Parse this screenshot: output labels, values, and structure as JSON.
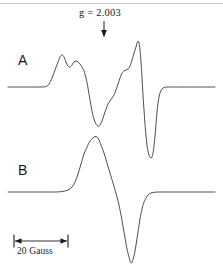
{
  "figure": {
    "type": "epr-spectrum-figure",
    "width": 223,
    "height": 277,
    "background_color": "#ffffff",
    "line_color": "#3a3a3a",
    "text_color": "#1a1a1a",
    "top_rule_color": "#c9c9c9"
  },
  "annotations": {
    "g_marker": {
      "label": "g = 2.003",
      "value": "2.003",
      "symbol": "g",
      "arrow_icon": "down-arrow-icon",
      "arrow_x": 104,
      "arrow_y_top": 21,
      "arrow_y_bottom": 37
    },
    "trace_a_label": "A",
    "trace_b_label": "B",
    "scale_bar": {
      "label": "20 Gauss",
      "value": 20,
      "unit": "Gauss",
      "x_start": 14,
      "x_end": 68,
      "y": 241
    }
  },
  "chart_data": {
    "type": "line",
    "title": "",
    "subtitle": "",
    "xlabel": "",
    "ylabel": "",
    "grid": false,
    "legend_position": "inline-left",
    "axis_note": "EPR first-derivative spectra; horizontal axis is magnetic field, scale bar = 20 Gauss; vertical axis arbitrary intensity",
    "annotations": [
      {
        "text": "g = 2.003",
        "x": 104,
        "kind": "field-marker-arrow"
      },
      {
        "text": "20 Gauss",
        "kind": "scale-bar"
      }
    ],
    "series": [
      {
        "name": "A",
        "label": "A",
        "baseline_y": 87,
        "color": "#3a3a3a",
        "description": "Derivative EPR trace with resolved hyperfine shoulders: small positive peak, secondary shoulder, deep negative trough, rising edge with shoulder, tall positive peak, then sharp deep negative spike returning to baseline",
        "points": [
          [
            8,
            87
          ],
          [
            30,
            87
          ],
          [
            40,
            87
          ],
          [
            46,
            86.5
          ],
          [
            49,
            84
          ],
          [
            52,
            78
          ],
          [
            55,
            70
          ],
          [
            58,
            62
          ],
          [
            60,
            57
          ],
          [
            62,
            55
          ],
          [
            64,
            57
          ],
          [
            66,
            62
          ],
          [
            68,
            66
          ],
          [
            70,
            67
          ],
          [
            72,
            65
          ],
          [
            74,
            62
          ],
          [
            76,
            61
          ],
          [
            78,
            62
          ],
          [
            80,
            64
          ],
          [
            82,
            67
          ],
          [
            84,
            71
          ],
          [
            86,
            78
          ],
          [
            88,
            88
          ],
          [
            90,
            100
          ],
          [
            92,
            111
          ],
          [
            94,
            119
          ],
          [
            96,
            124
          ],
          [
            98,
            126
          ],
          [
            100,
            125
          ],
          [
            102,
            121
          ],
          [
            104,
            115
          ],
          [
            106,
            109
          ],
          [
            108,
            104
          ],
          [
            110,
            101
          ],
          [
            112,
            98
          ],
          [
            114,
            95
          ],
          [
            116,
            90
          ],
          [
            118,
            84
          ],
          [
            120,
            78
          ],
          [
            122,
            73
          ],
          [
            124,
            71
          ],
          [
            126,
            70
          ],
          [
            128,
            69
          ],
          [
            130,
            66
          ],
          [
            132,
            60
          ],
          [
            134,
            53
          ],
          [
            136,
            47
          ],
          [
            137,
            43
          ],
          [
            138,
            41
          ],
          [
            139,
            43
          ],
          [
            140,
            50
          ],
          [
            141,
            62
          ],
          [
            142,
            78
          ],
          [
            143,
            95
          ],
          [
            144,
            110
          ],
          [
            145,
            124
          ],
          [
            146,
            136
          ],
          [
            147,
            145
          ],
          [
            148,
            151
          ],
          [
            149,
            155
          ],
          [
            150,
            157
          ],
          [
            151,
            158
          ],
          [
            152,
            157
          ],
          [
            153,
            153
          ],
          [
            154,
            146
          ],
          [
            155,
            136
          ],
          [
            156,
            124
          ],
          [
            157,
            112
          ],
          [
            158,
            103
          ],
          [
            159,
            97
          ],
          [
            160,
            93
          ],
          [
            162,
            89
          ],
          [
            164,
            87.5
          ],
          [
            167,
            87
          ],
          [
            172,
            87
          ],
          [
            180,
            87
          ],
          [
            200,
            87
          ],
          [
            215,
            87
          ]
        ]
      },
      {
        "name": "B",
        "label": "B",
        "baseline_y": 192,
        "color": "#3a3a3a",
        "description": "Smooth single-line derivative EPR trace: broad positive lobe, zero crossing, deep narrow negative lobe, return to baseline",
        "points": [
          [
            8,
            192
          ],
          [
            40,
            192
          ],
          [
            55,
            192
          ],
          [
            62,
            191.5
          ],
          [
            68,
            190
          ],
          [
            72,
            187
          ],
          [
            75,
            182
          ],
          [
            78,
            174
          ],
          [
            81,
            164
          ],
          [
            84,
            154
          ],
          [
            87,
            147
          ],
          [
            90,
            141
          ],
          [
            93,
            138
          ],
          [
            95,
            136.5
          ],
          [
            97,
            137
          ],
          [
            99,
            140
          ],
          [
            101,
            145
          ],
          [
            104,
            153
          ],
          [
            107,
            163
          ],
          [
            110,
            173
          ],
          [
            113,
            183
          ],
          [
            115,
            190
          ],
          [
            117,
            197
          ],
          [
            119,
            205
          ],
          [
            121,
            215
          ],
          [
            123,
            226
          ],
          [
            125,
            238
          ],
          [
            127,
            249
          ],
          [
            129,
            257
          ],
          [
            130,
            261
          ],
          [
            131,
            263
          ],
          [
            132,
            262
          ],
          [
            134,
            256
          ],
          [
            136,
            245
          ],
          [
            138,
            232
          ],
          [
            140,
            219
          ],
          [
            142,
            209
          ],
          [
            144,
            202
          ],
          [
            146,
            198
          ],
          [
            148,
            195
          ],
          [
            151,
            193
          ],
          [
            155,
            192.2
          ],
          [
            160,
            192
          ],
          [
            170,
            192
          ],
          [
            190,
            192
          ],
          [
            215,
            192
          ]
        ]
      }
    ]
  }
}
